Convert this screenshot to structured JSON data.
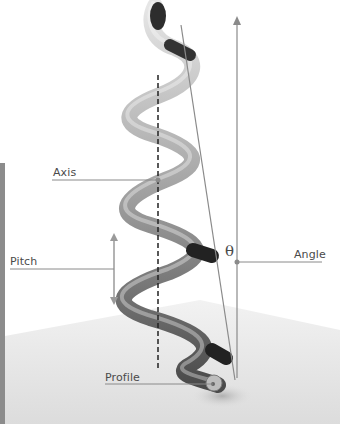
{
  "diagram": {
    "labels": {
      "axis": "Axis",
      "pitch": "Pitch",
      "angle": "Angle",
      "profile": "Profile",
      "theta": "θ"
    },
    "colors": {
      "leader_line": "#8a8a8a",
      "tube_light": "#cfcfcf",
      "tube_dark": "#2a2a2a",
      "ground": "#e6e6e6",
      "background": "#ffffff"
    }
  }
}
